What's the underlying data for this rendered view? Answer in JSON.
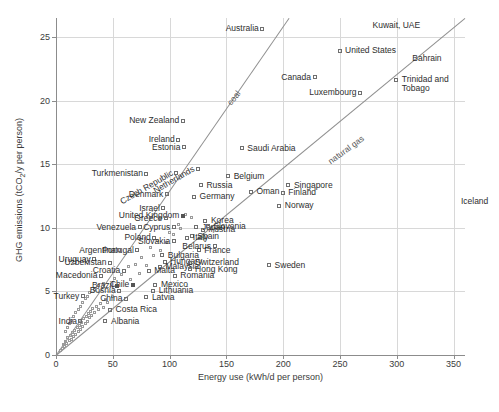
{
  "chart_data": {
    "type": "scatter",
    "title": "",
    "xlabel": "Energy use (kWh/d per person)",
    "ylabel": "GHG emissions (tCO₂/y per person)",
    "xlim": [
      0,
      360
    ],
    "ylim": [
      0,
      26.5
    ],
    "xticks": [
      0,
      50,
      100,
      150,
      200,
      250,
      300,
      350
    ],
    "yticks": [
      0,
      5,
      10,
      15,
      20,
      25
    ],
    "grid": true,
    "legend": "none",
    "annotations": [
      {
        "text": "coal",
        "rotation": -52,
        "x": 152,
        "y": 20.1
      },
      {
        "text": "natural gas",
        "rotation": -36,
        "x": 240,
        "y": 15.6
      }
    ],
    "trendlines": [
      {
        "name": "coal",
        "x0": 0,
        "y0": 0,
        "x1": 205,
        "y1": 26.5
      },
      {
        "name": "natural gas",
        "x0": 0,
        "y0": 0,
        "x1": 360,
        "y1": 26.5
      }
    ],
    "points": [
      {
        "label": "Australia",
        "x": 182,
        "y": 25.6,
        "anchor": "left"
      },
      {
        "label": "Kuwait, UAE",
        "x": 305,
        "y": 25.9,
        "anchor": "right-free"
      },
      {
        "label": "United States",
        "x": 250,
        "y": 23.9,
        "anchor": "right"
      },
      {
        "label": "Bahrain",
        "x": 340,
        "y": 23.3,
        "anchor": "right-free"
      },
      {
        "label": "Canada",
        "x": 228,
        "y": 21.8,
        "anchor": "left"
      },
      {
        "label": "Trinidad and Tobago",
        "x": 300,
        "y": 21.6,
        "anchor": "right"
      },
      {
        "label": "Luxembourg",
        "x": 268,
        "y": 20.6,
        "anchor": "left"
      },
      {
        "label": "New Zealand",
        "x": 112,
        "y": 18.4,
        "anchor": "left"
      },
      {
        "label": "Ireland",
        "x": 108,
        "y": 16.9,
        "anchor": "left"
      },
      {
        "label": "Estonia",
        "x": 113,
        "y": 16.3,
        "anchor": "left"
      },
      {
        "label": "Saudi Arabia",
        "x": 164,
        "y": 16.2,
        "anchor": "right"
      },
      {
        "label": "Netherlands",
        "x": 125,
        "y": 14.6,
        "anchor": "rot"
      },
      {
        "label": "Czech Republic",
        "x": 106,
        "y": 14.3,
        "anchor": "rot"
      },
      {
        "label": "Turkmenistan",
        "x": 80,
        "y": 14.2,
        "anchor": "left"
      },
      {
        "label": "Belgium",
        "x": 152,
        "y": 14.0,
        "anchor": "right"
      },
      {
        "label": "Singapore",
        "x": 205,
        "y": 13.3,
        "anchor": "right"
      },
      {
        "label": "Russia",
        "x": 128,
        "y": 13.3,
        "anchor": "right"
      },
      {
        "label": "Finland",
        "x": 200,
        "y": 12.7,
        "anchor": "right"
      },
      {
        "label": "Oman",
        "x": 172,
        "y": 12.8,
        "anchor": "right"
      },
      {
        "label": "Denmark",
        "x": 98,
        "y": 12.6,
        "anchor": "left"
      },
      {
        "label": "Germany",
        "x": 122,
        "y": 12.4,
        "anchor": "right"
      },
      {
        "label": "Norway",
        "x": 197,
        "y": 11.7,
        "anchor": "right"
      },
      {
        "label": "Israel",
        "x": 95,
        "y": 11.5,
        "anchor": "left"
      },
      {
        "label": "United Kingdom",
        "x": 112,
        "y": 10.9,
        "anchor": "right-dot"
      },
      {
        "label": "Greece",
        "x": 97,
        "y": 10.7,
        "anchor": "left"
      },
      {
        "label": "Korea",
        "x": 132,
        "y": 10.5,
        "anchor": "right"
      },
      {
        "label": "Japan",
        "x": 124,
        "y": 10.0,
        "anchor": "right"
      },
      {
        "label": "Austria",
        "x": 130,
        "y": 9.8,
        "anchor": "right"
      },
      {
        "label": "Venezuela",
        "x": 74,
        "y": 10.0,
        "anchor": "left"
      },
      {
        "label": "Cyprus",
        "x": 104,
        "y": 10.0,
        "anchor": "left"
      },
      {
        "label": "Slovenia",
        "x": 134,
        "y": 10.1,
        "anchor": "right"
      },
      {
        "label": "Poland",
        "x": 87,
        "y": 9.2,
        "anchor": "left"
      },
      {
        "label": "Spain",
        "x": 120,
        "y": 9.3,
        "anchor": "right"
      },
      {
        "label": "Italy",
        "x": 116,
        "y": 9.2,
        "anchor": "right"
      },
      {
        "label": "Slovakia",
        "x": 104,
        "y": 8.9,
        "anchor": "left"
      },
      {
        "label": "France",
        "x": 126,
        "y": 8.2,
        "anchor": "right"
      },
      {
        "label": "Belarus",
        "x": 140,
        "y": 8.5,
        "anchor": "left"
      },
      {
        "label": "Portugal",
        "x": 72,
        "y": 8.2,
        "anchor": "left"
      },
      {
        "label": "Argentina",
        "x": 56,
        "y": 8.2,
        "anchor": "left"
      },
      {
        "label": "Bulgaria",
        "x": 94,
        "y": 7.8,
        "anchor": "right"
      },
      {
        "label": "Hungary",
        "x": 96,
        "y": 7.3,
        "anchor": "right"
      },
      {
        "label": "Uruguay",
        "x": 34,
        "y": 7.5,
        "anchor": "left"
      },
      {
        "label": "Uzbekistan",
        "x": 48,
        "y": 7.2,
        "anchor": "left"
      },
      {
        "label": "Switzerland",
        "x": 118,
        "y": 7.2,
        "anchor": "right"
      },
      {
        "label": "Malaysia",
        "x": 92,
        "y": 6.9,
        "anchor": "right"
      },
      {
        "label": "Hong Kong",
        "x": 118,
        "y": 6.7,
        "anchor": "right"
      },
      {
        "label": "Croatia",
        "x": 60,
        "y": 6.6,
        "anchor": "left"
      },
      {
        "label": "Malta",
        "x": 82,
        "y": 6.6,
        "anchor": "right"
      },
      {
        "label": "Macedonia",
        "x": 40,
        "y": 6.2,
        "anchor": "left"
      },
      {
        "label": "Romania",
        "x": 105,
        "y": 6.2,
        "anchor": "right"
      },
      {
        "label": "Chile",
        "x": 68,
        "y": 5.5,
        "anchor": "right-dot"
      },
      {
        "label": "Mexico",
        "x": 88,
        "y": 5.5,
        "anchor": "right"
      },
      {
        "label": "Brazil",
        "x": 54,
        "y": 5.4,
        "anchor": "right-dot"
      },
      {
        "label": "Bosnia",
        "x": 56,
        "y": 5.0,
        "anchor": "left"
      },
      {
        "label": "Lithuania",
        "x": 86,
        "y": 5.0,
        "anchor": "right"
      },
      {
        "label": "Turkey",
        "x": 24,
        "y": 4.6,
        "anchor": "left"
      },
      {
        "label": "China",
        "x": 62,
        "y": 4.4,
        "anchor": "left"
      },
      {
        "label": "Latvia",
        "x": 80,
        "y": 4.5,
        "anchor": "right"
      },
      {
        "label": "Costa Rica",
        "x": 48,
        "y": 3.5,
        "anchor": "right"
      },
      {
        "label": "India",
        "x": 22,
        "y": 2.6,
        "anchor": "left"
      },
      {
        "label": "Albania",
        "x": 44,
        "y": 2.6,
        "anchor": "right"
      },
      {
        "label": "Sweden",
        "x": 188,
        "y": 7.0,
        "anchor": "right"
      },
      {
        "label": "Iceland",
        "x": 352,
        "y": 12.0,
        "anchor": "clip"
      }
    ],
    "unlabeled_points": [
      [
        4,
        0.3
      ],
      [
        6,
        0.5
      ],
      [
        7,
        0.8
      ],
      [
        8,
        0.6
      ],
      [
        9,
        1.0
      ],
      [
        10,
        0.9
      ],
      [
        11,
        1.3
      ],
      [
        12,
        1.1
      ],
      [
        13,
        1.5
      ],
      [
        14,
        1.2
      ],
      [
        15,
        1.7
      ],
      [
        16,
        1.4
      ],
      [
        17,
        1.9
      ],
      [
        18,
        1.6
      ],
      [
        19,
        2.1
      ],
      [
        20,
        1.8
      ],
      [
        21,
        2.3
      ],
      [
        22,
        2.0
      ],
      [
        23,
        2.5
      ],
      [
        24,
        2.2
      ],
      [
        25,
        2.8
      ],
      [
        26,
        2.4
      ],
      [
        27,
        3.0
      ],
      [
        28,
        2.6
      ],
      [
        29,
        3.2
      ],
      [
        30,
        2.9
      ],
      [
        31,
        3.4
      ],
      [
        32,
        3.1
      ],
      [
        33,
        3.6
      ],
      [
        34,
        3.3
      ],
      [
        36,
        3.8
      ],
      [
        38,
        3.5
      ],
      [
        40,
        4.0
      ],
      [
        42,
        3.7
      ],
      [
        44,
        4.3
      ],
      [
        46,
        4.1
      ],
      [
        12,
        2.4
      ],
      [
        14,
        2.7
      ],
      [
        16,
        3.0
      ],
      [
        18,
        3.3
      ],
      [
        20,
        3.5
      ],
      [
        22,
        3.8
      ],
      [
        24,
        4.1
      ],
      [
        26,
        4.4
      ],
      [
        28,
        4.6
      ],
      [
        30,
        4.9
      ],
      [
        9,
        1.8
      ],
      [
        11,
        2.1
      ],
      [
        34,
        5.1
      ],
      [
        38,
        5.4
      ],
      [
        42,
        5.6
      ],
      [
        50,
        4.6
      ],
      [
        52,
        6.0
      ],
      [
        58,
        6.3
      ],
      [
        64,
        6.9
      ],
      [
        70,
        7.1
      ],
      [
        76,
        7.6
      ],
      [
        84,
        8.4
      ],
      [
        90,
        9.0
      ],
      [
        100,
        9.6
      ],
      [
        108,
        10.2
      ],
      [
        114,
        11.0
      ],
      [
        120,
        10.8
      ],
      [
        66,
        5.9
      ],
      [
        74,
        6.4
      ],
      [
        80,
        7.0
      ],
      [
        86,
        7.8
      ],
      [
        92,
        8.2
      ],
      [
        98,
        8.8
      ],
      [
        104,
        9.4
      ],
      [
        110,
        9.9
      ]
    ]
  }
}
